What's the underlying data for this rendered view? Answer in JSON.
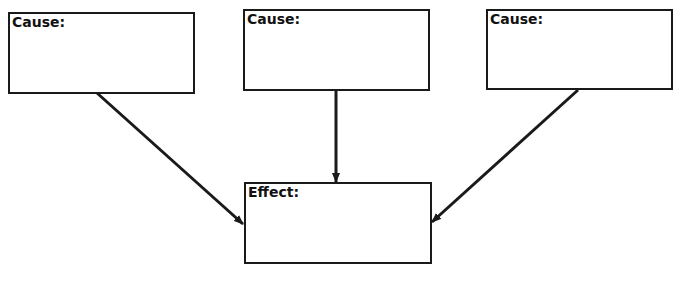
{
  "diagram": {
    "type": "cause-effect",
    "causes": [
      {
        "label": "Cause:",
        "x": 8,
        "y": 12,
        "w": 187,
        "h": 82
      },
      {
        "label": "Cause:",
        "x": 243,
        "y": 9,
        "w": 187,
        "h": 82
      },
      {
        "label": "Cause:",
        "x": 486,
        "y": 9,
        "w": 187,
        "h": 81
      }
    ],
    "effect": {
      "label": "Effect:",
      "x": 244,
      "y": 182,
      "w": 188,
      "h": 82
    },
    "arrows": [
      {
        "from": "cause-1",
        "to": "effect",
        "x1": 97,
        "y1": 93,
        "x2": 243,
        "y2": 224
      },
      {
        "from": "cause-2",
        "to": "effect",
        "x1": 336,
        "y1": 90,
        "x2": 336,
        "y2": 182
      },
      {
        "from": "cause-3",
        "to": "effect",
        "x1": 578,
        "y1": 90,
        "x2": 432,
        "y2": 222
      }
    ],
    "line_color": "#1a1a1a"
  }
}
